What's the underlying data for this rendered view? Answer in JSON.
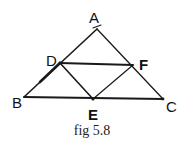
{
  "figure": {
    "caption": "fig 5.8",
    "points": {
      "A": {
        "label": "A",
        "x": 97,
        "y": 29
      },
      "B": {
        "label": "B",
        "x": 24,
        "y": 97
      },
      "C": {
        "label": "C",
        "x": 163,
        "y": 99
      },
      "D": {
        "label": "D",
        "x": 60,
        "y": 63
      },
      "E": {
        "label": "E",
        "x": 93,
        "y": 99
      },
      "F": {
        "label": "F",
        "x": 133,
        "y": 65
      }
    },
    "segments": [
      "AB",
      "AC",
      "BC",
      "DF",
      "DE",
      "EF"
    ],
    "stroke_color": "#1a1a1a"
  }
}
